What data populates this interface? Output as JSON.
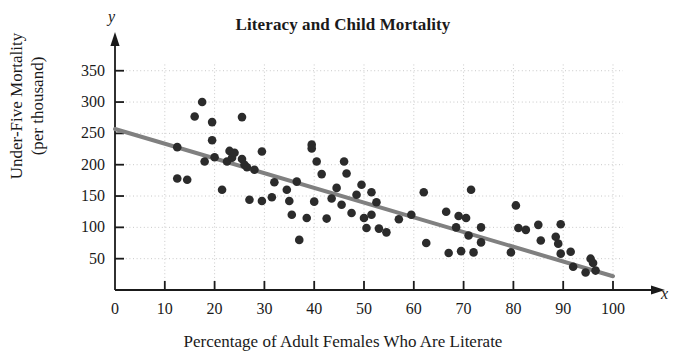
{
  "chart_data": {
    "type": "scatter",
    "title": "Literacy and Child Mortality",
    "xlabel": "Percentage of Adult Females Who Are Literate",
    "ylabel_line1": "Under-Five Mortality",
    "ylabel_line2": "(per thousand)",
    "x_axis_variable": "x",
    "y_axis_variable": "y",
    "xlim": [
      0,
      103
    ],
    "ylim": [
      0,
      375
    ],
    "xticks": [
      0,
      10,
      20,
      30,
      40,
      50,
      60,
      70,
      80,
      90,
      100
    ],
    "xtick_labels": [
      "0",
      "10",
      "20",
      "30",
      "40",
      "50",
      "60",
      "70",
      "80",
      "90",
      "100"
    ],
    "yticks": [
      50,
      100,
      150,
      200,
      250,
      300,
      350
    ],
    "ytick_labels": [
      "50",
      "100",
      "150",
      "200",
      "250",
      "300",
      "350"
    ],
    "grid": true,
    "grid_style": "dotted",
    "grid_color": "#c8c8c8",
    "marker_color": "#2b2b2b",
    "marker_size": 7,
    "trendline": {
      "label": "least-squares regression line",
      "color": "#808080",
      "width": 4,
      "x_start": 0,
      "y_start": 257,
      "x_end": 100,
      "y_end": 22
    },
    "points": [
      [
        12.5,
        228
      ],
      [
        12.5,
        178
      ],
      [
        14.5,
        176
      ],
      [
        16.0,
        277
      ],
      [
        17.5,
        300
      ],
      [
        18.0,
        205
      ],
      [
        19.5,
        268
      ],
      [
        19.5,
        239
      ],
      [
        20.0,
        212
      ],
      [
        21.5,
        160
      ],
      [
        22.5,
        205
      ],
      [
        23.0,
        222
      ],
      [
        23.5,
        211
      ],
      [
        24.0,
        219
      ],
      [
        25.5,
        209
      ],
      [
        25.5,
        276
      ],
      [
        26.0,
        200
      ],
      [
        26.5,
        196
      ],
      [
        27.0,
        144
      ],
      [
        28.0,
        192
      ],
      [
        29.5,
        221
      ],
      [
        29.5,
        142
      ],
      [
        31.5,
        148
      ],
      [
        32.0,
        172
      ],
      [
        34.5,
        160
      ],
      [
        35.0,
        142
      ],
      [
        35.5,
        120
      ],
      [
        36.5,
        173
      ],
      [
        37.0,
        80
      ],
      [
        38.5,
        115
      ],
      [
        39.5,
        232
      ],
      [
        39.5,
        226
      ],
      [
        40.0,
        141
      ],
      [
        40.5,
        205
      ],
      [
        41.5,
        185
      ],
      [
        42.5,
        114
      ],
      [
        43.5,
        146
      ],
      [
        44.5,
        163
      ],
      [
        45.5,
        136
      ],
      [
        46.0,
        205
      ],
      [
        46.5,
        186
      ],
      [
        47.5,
        123
      ],
      [
        48.5,
        152
      ],
      [
        49.5,
        168
      ],
      [
        50.0,
        115
      ],
      [
        50.5,
        99
      ],
      [
        51.5,
        156
      ],
      [
        51.5,
        120
      ],
      [
        52.5,
        140
      ],
      [
        53.0,
        98
      ],
      [
        54.5,
        92
      ],
      [
        57.0,
        113
      ],
      [
        59.5,
        120
      ],
      [
        62.0,
        156
      ],
      [
        62.5,
        75
      ],
      [
        66.5,
        125
      ],
      [
        67.0,
        59
      ],
      [
        68.5,
        100
      ],
      [
        69.0,
        118
      ],
      [
        69.5,
        62
      ],
      [
        70.5,
        115
      ],
      [
        71.0,
        87
      ],
      [
        71.5,
        160
      ],
      [
        72.0,
        60
      ],
      [
        73.5,
        100
      ],
      [
        73.5,
        76
      ],
      [
        79.5,
        60
      ],
      [
        80.5,
        135
      ],
      [
        81.0,
        99
      ],
      [
        82.5,
        96
      ],
      [
        85.0,
        104
      ],
      [
        85.5,
        79
      ],
      [
        88.5,
        85
      ],
      [
        89.0,
        74
      ],
      [
        89.5,
        58
      ],
      [
        89.5,
        105
      ],
      [
        91.5,
        61
      ],
      [
        92.0,
        37
      ],
      [
        94.5,
        28
      ],
      [
        95.5,
        50
      ],
      [
        96.0,
        43
      ],
      [
        96.5,
        31
      ]
    ]
  }
}
